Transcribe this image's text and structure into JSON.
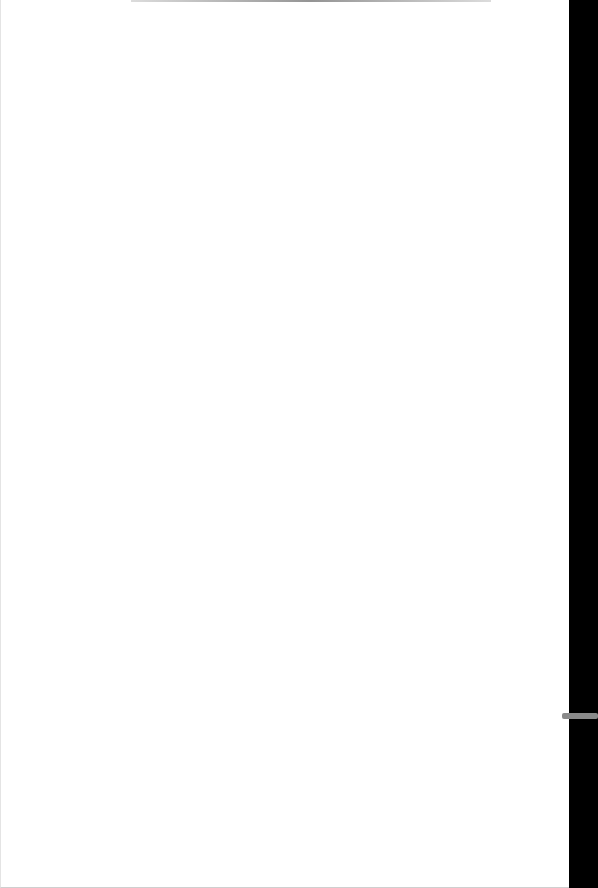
{
  "document": {
    "title": "",
    "content": "",
    "page_color": "#ffffff",
    "edge_color": "#000000",
    "tab_color": "#8a8a8a"
  }
}
